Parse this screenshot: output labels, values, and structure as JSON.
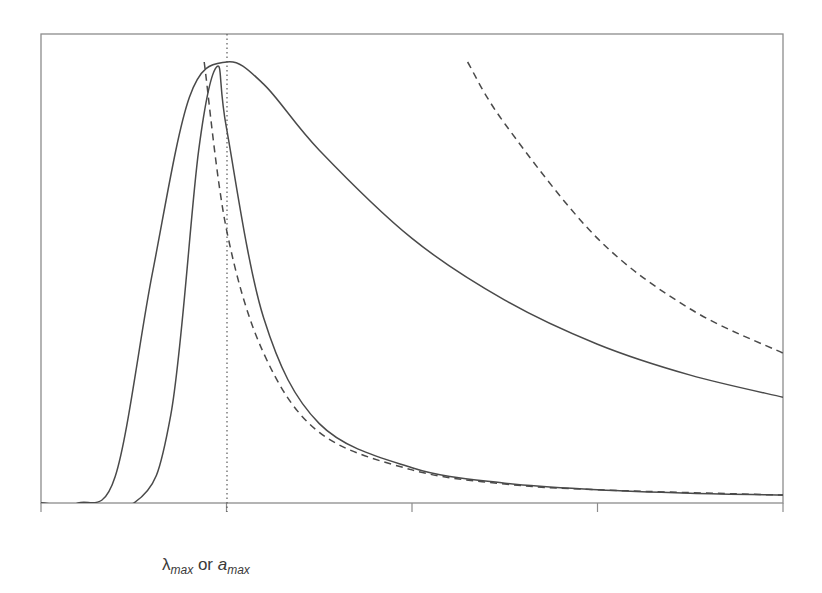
{
  "chart_data": {
    "type": "line",
    "title": "",
    "xlabel": "λmax or amax",
    "ylabel": "",
    "xlabel_parts": {
      "symbol1": "λ",
      "sub1": "max",
      "connector": " or ",
      "symbol2": "a",
      "sub2": "max"
    },
    "x_ticks": [
      "",
      "",
      "",
      "",
      ""
    ],
    "y_ticks": [],
    "grid": false,
    "legend": null,
    "xlim": [
      0,
      4
    ],
    "ylim": [
      0,
      1.0
    ],
    "annotations": [
      {
        "type": "vertical-dotted-line",
        "x": 1.0,
        "label": "λmax or amax"
      }
    ],
    "series": [
      {
        "name": "broad distribution (solid)",
        "style": "solid",
        "x": [
          0.2,
          0.4,
          0.6,
          0.8,
          1.0,
          1.2,
          1.5,
          2.0,
          2.5,
          3.0,
          3.5,
          4.0
        ],
        "y": [
          0.0,
          0.06,
          0.52,
          0.92,
          1.0,
          0.95,
          0.8,
          0.6,
          0.46,
          0.36,
          0.29,
          0.24
        ]
      },
      {
        "name": "narrow distribution (solid)",
        "style": "solid",
        "x": [
          0.5,
          0.7,
          0.85,
          0.95,
          1.0,
          1.2,
          1.5,
          2.0,
          2.5,
          3.0,
          3.5,
          4.0
        ],
        "y": [
          0.0,
          0.2,
          0.8,
          0.99,
          0.85,
          0.42,
          0.18,
          0.08,
          0.045,
          0.03,
          0.022,
          0.018
        ]
      },
      {
        "name": "asymptote of narrow (dashed)",
        "style": "dashed",
        "x": [
          0.88,
          1.0,
          1.2,
          1.5,
          2.0,
          2.5,
          3.0,
          4.0
        ],
        "y": [
          1.0,
          0.62,
          0.34,
          0.16,
          0.075,
          0.043,
          0.03,
          0.018
        ]
      },
      {
        "name": "asymptote of broad (dashed)",
        "style": "dashed",
        "x": [
          2.3,
          2.5,
          3.0,
          3.5,
          4.0
        ],
        "y": [
          1.0,
          0.86,
          0.6,
          0.44,
          0.34
        ]
      }
    ]
  },
  "figure": {
    "frame_color": "#8c8c8c",
    "curve_color": "#4a4a4a",
    "label_color": "#3a3a3a"
  }
}
